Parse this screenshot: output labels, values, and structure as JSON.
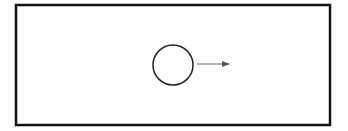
{
  "diagram": {
    "frame": {
      "x": 16,
      "y": 5,
      "width": 314,
      "height": 120,
      "stroke": "#111111",
      "stroke_width": 2.5
    },
    "circle": {
      "cx": 173,
      "cy": 65,
      "r": 20,
      "stroke": "#222222",
      "stroke_width": 1.5
    },
    "arrow": {
      "x1": 197,
      "y1": 64,
      "x2": 229,
      "y2": 64,
      "stroke": "#666666",
      "stroke_width": 1,
      "direction": "right"
    }
  }
}
